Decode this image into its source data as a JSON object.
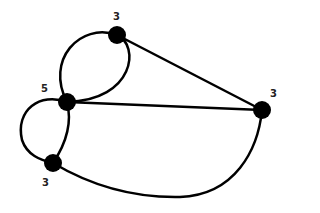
{
  "graph": {
    "nodes": [
      {
        "id": "A",
        "label": "3",
        "x": 117,
        "y": 35
      },
      {
        "id": "B",
        "label": "5",
        "x": 67,
        "y": 102
      },
      {
        "id": "C",
        "label": "3",
        "x": 262,
        "y": 110
      },
      {
        "id": "D",
        "label": "3",
        "x": 53,
        "y": 163
      }
    ],
    "edges": [
      {
        "from": "A",
        "to": "B",
        "shape": "curve-left"
      },
      {
        "from": "A",
        "to": "B",
        "shape": "curve-right"
      },
      {
        "from": "A",
        "to": "C",
        "shape": "straight"
      },
      {
        "from": "B",
        "to": "C",
        "shape": "straight"
      },
      {
        "from": "B",
        "to": "D",
        "shape": "curve-left"
      },
      {
        "from": "B",
        "to": "D",
        "shape": "curve-right"
      },
      {
        "from": "D",
        "to": "C",
        "shape": "curve-bottom"
      }
    ],
    "colors": {
      "stroke": "#000000",
      "node": "#000000",
      "label": "#222222"
    }
  }
}
